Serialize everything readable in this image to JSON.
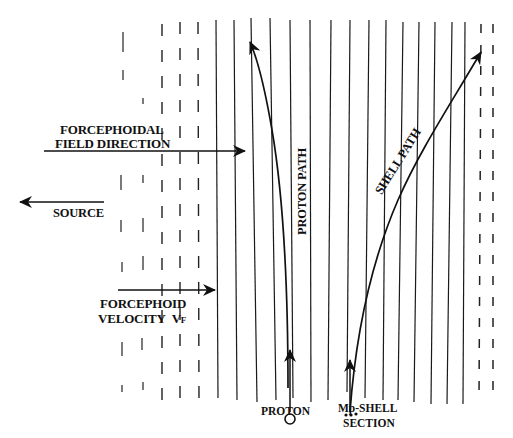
{
  "caption_fragment": "g... p...",
  "labels": {
    "field_direction_line1": "FORCEPHOIDAL",
    "field_direction_line2": "FIELD DIRECTION",
    "source": "SOURCE",
    "velocity_line1": "FORCEPHOID",
    "velocity_line2": "VELOCITY",
    "velocity_symbol": "V",
    "velocity_subscript": "F",
    "proton_path": "PROTON PATH",
    "shell_path": "SHELL PATH",
    "proton": "PROTON",
    "shell_section_line1": "Mp-SHELL",
    "shell_section_line2": "SECTION"
  },
  "colors": {
    "ink": "#111111",
    "background": "#ffffff"
  },
  "field_lines": {
    "description": "Vertical forcephoid field lines; dashed on the left and far right, solid in the middle",
    "x_positions": [
      123,
      143,
      162,
      180,
      199,
      218,
      237,
      257,
      276,
      293,
      311,
      328,
      347,
      365,
      383,
      398,
      414,
      431,
      447,
      463,
      479,
      493
    ],
    "styles": [
      "sparse",
      "sparse",
      "dashed",
      "dashed",
      "dashed",
      "solid",
      "solid",
      "solid",
      "solid",
      "solid",
      "solid",
      "solid",
      "solid",
      "solid",
      "solid",
      "solid",
      "solid",
      "solid",
      "solid",
      "solid",
      "dashed",
      "dashed"
    ]
  },
  "arrows": {
    "field_direction": {
      "x1": 44,
      "y1": 151,
      "x2": 245,
      "y2": 151
    },
    "source": {
      "x1": 104,
      "y1": 202,
      "x2": 20,
      "y2": 202
    },
    "velocity": {
      "x1": 118,
      "y1": 290,
      "x2": 215,
      "y2": 290
    }
  }
}
